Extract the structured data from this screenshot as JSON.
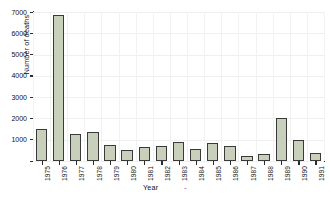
{
  "chart_data": {
    "type": "bar",
    "title": "",
    "xlabel": "Year",
    "ylabel": "Number of deaths",
    "categories": [
      "1975",
      "1976",
      "1977",
      "1978",
      "1979",
      "1980",
      "1981",
      "1982",
      "1983",
      "1984",
      "1985",
      "1986",
      "1987",
      "1988",
      "1989",
      "1990",
      "1991"
    ],
    "values": [
      1500,
      6850,
      1250,
      1350,
      750,
      500,
      650,
      700,
      900,
      550,
      850,
      700,
      250,
      350,
      2000,
      1000,
      400
    ],
    "ylim": [
      0,
      7000
    ],
    "yticks": [
      0,
      1000,
      2000,
      3000,
      4000,
      5000,
      6000,
      7000
    ],
    "ytick_labels": [
      "",
      "1000",
      "2000",
      "3000",
      "4000",
      "5000",
      "6000",
      "7000"
    ],
    "grid": true,
    "legend": null,
    "bar_fill_color": "#c8d0bc",
    "bar_edge_color": "#3a3a3a",
    "axis_color": "#2b2b2b",
    "background_color": "#ffffff",
    "xlabel_extra_mark": "-"
  }
}
